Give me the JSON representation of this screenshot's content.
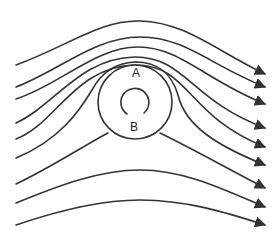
{
  "diagram": {
    "type": "streamlines around rotating cylinder",
    "labels": {
      "top": "A",
      "bottom": "B"
    },
    "colors": {
      "line": "#333333",
      "background": "#ffffff"
    },
    "streamline_count": 9,
    "rotation_indicator": "arc-arrow-icon"
  }
}
